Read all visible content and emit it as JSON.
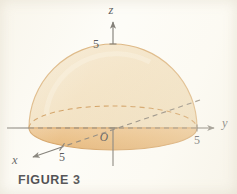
{
  "figure": {
    "caption": "FIGURE 3",
    "background_color": "#fdfcf7",
    "axes": {
      "z": {
        "letter": "z",
        "tick_label": "5"
      },
      "y": {
        "letter": "y",
        "tick_label": "5"
      },
      "x": {
        "letter": "x",
        "tick_label": "5"
      },
      "origin_label": "O"
    },
    "solid": {
      "name": "hemisphere",
      "radius": 5,
      "dome_fill": "#f3e3c4",
      "dome_stroke": "#d8a96a",
      "base_disk_fill": "#e8b878",
      "base_disk_stroke": "#cf9650"
    },
    "line_color": "#6e6a62",
    "text_color": "#3a3a3e"
  }
}
